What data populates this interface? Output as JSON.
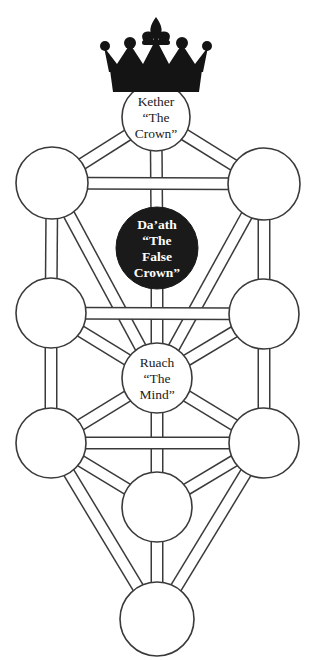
{
  "diagram": {
    "background_color": "#ffffff",
    "stroke_color": "#3a3a3a",
    "node_fill": "#ffffff",
    "daath_fill": "#1a1a1a",
    "daath_text_color": "#ffffff",
    "label_color": "#222222",
    "crown_color": "#141414"
  },
  "nodes": [
    {
      "id": "kether",
      "name": "kether-sephirah",
      "cx": 156,
      "cy": 117,
      "r": 34,
      "filled": false,
      "labels": [
        "Kether",
        "“The",
        "Crown”"
      ]
    },
    {
      "id": "binah",
      "name": "binah-sephirah",
      "cx": 52,
      "cy": 183,
      "r": 36,
      "filled": false,
      "labels": []
    },
    {
      "id": "chokmah",
      "name": "chokmah-sephirah",
      "cx": 264,
      "cy": 184,
      "r": 36,
      "filled": false,
      "labels": []
    },
    {
      "id": "daath",
      "name": "daath-sephirah",
      "cx": 157,
      "cy": 248,
      "r": 41,
      "filled": true,
      "labels": [
        "Da’ath",
        "“The",
        "False",
        "Crown”"
      ]
    },
    {
      "id": "geburah",
      "name": "geburah-sephirah",
      "cx": 51,
      "cy": 313,
      "r": 35,
      "filled": false,
      "labels": []
    },
    {
      "id": "chesed",
      "name": "chesed-sephirah",
      "cx": 264,
      "cy": 314,
      "r": 35,
      "filled": false,
      "labels": []
    },
    {
      "id": "tiphereth",
      "name": "tiphereth-ruach-sephirah",
      "cx": 157,
      "cy": 378,
      "r": 35,
      "filled": false,
      "labels": [
        "Ruach",
        "“The",
        "Mind”"
      ]
    },
    {
      "id": "hod",
      "name": "hod-sephirah",
      "cx": 51,
      "cy": 443,
      "r": 35,
      "filled": false,
      "labels": []
    },
    {
      "id": "netzach",
      "name": "netzach-sephirah",
      "cx": 264,
      "cy": 443,
      "r": 35,
      "filled": false,
      "labels": []
    },
    {
      "id": "yesod",
      "name": "yesod-sephirah",
      "cx": 157,
      "cy": 507,
      "r": 35,
      "filled": false,
      "labels": []
    },
    {
      "id": "malkuth",
      "name": "malkuth-sephirah",
      "cx": 157,
      "cy": 619,
      "r": 37,
      "filled": false,
      "labels": []
    }
  ],
  "paths": [
    {
      "from": "kether",
      "to": "binah"
    },
    {
      "from": "kether",
      "to": "chokmah"
    },
    {
      "from": "kether",
      "to": "daath"
    },
    {
      "from": "binah",
      "to": "chokmah"
    },
    {
      "from": "binah",
      "to": "geburah"
    },
    {
      "from": "binah",
      "to": "tiphereth"
    },
    {
      "from": "chokmah",
      "to": "chesed"
    },
    {
      "from": "chokmah",
      "to": "tiphereth"
    },
    {
      "from": "daath",
      "to": "tiphereth"
    },
    {
      "from": "geburah",
      "to": "chesed"
    },
    {
      "from": "geburah",
      "to": "tiphereth"
    },
    {
      "from": "geburah",
      "to": "hod"
    },
    {
      "from": "chesed",
      "to": "tiphereth"
    },
    {
      "from": "chesed",
      "to": "netzach"
    },
    {
      "from": "tiphereth",
      "to": "hod"
    },
    {
      "from": "tiphereth",
      "to": "netzach"
    },
    {
      "from": "tiphereth",
      "to": "yesod"
    },
    {
      "from": "hod",
      "to": "netzach"
    },
    {
      "from": "hod",
      "to": "yesod"
    },
    {
      "from": "hod",
      "to": "malkuth"
    },
    {
      "from": "netzach",
      "to": "yesod"
    },
    {
      "from": "netzach",
      "to": "malkuth"
    },
    {
      "from": "yesod",
      "to": "malkuth"
    }
  ],
  "crown": {
    "name": "crown-icon",
    "cx": 156,
    "top": 17,
    "bottom": 92,
    "width": 104
  },
  "text_sizes": {
    "node_label_px": 13.5,
    "daath_label_px": 13.5,
    "line_height_px": 16
  }
}
